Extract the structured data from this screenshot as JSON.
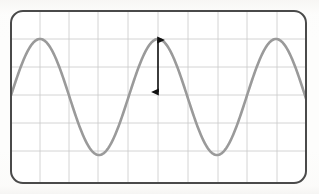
{
  "figure": {
    "kind": "oscilloscope-graticule-sine-wave",
    "width": 319,
    "height": 194,
    "background_color": "#fdfdfc"
  },
  "bezel": {
    "label": "screen-bezel",
    "x": 11,
    "y": 11,
    "width": 295,
    "height": 172,
    "corner_radius": 12,
    "stroke_color": "#4a4a4a",
    "stroke_width": 2.0,
    "fill_color": "#ffffff"
  },
  "graticule": {
    "label": "grid",
    "line_color": "#c9c9c9",
    "line_width": 0.8,
    "vertical_divisions": 10,
    "horizontal_divisions": 6,
    "vertical_line_x": [
      40,
      69,
      98,
      128,
      158,
      188,
      218,
      247,
      277
    ],
    "horizontal_line_y": [
      39,
      67,
      95,
      123,
      151
    ],
    "x_start": 11,
    "x_end": 306,
    "y_start": 11,
    "y_end": 183
  },
  "waveform": {
    "label": "sine-wave-trace",
    "stroke_color": "#9a9a9a",
    "stroke_width": 2.6,
    "shape": "sine",
    "cycles": 2.5,
    "period_px": 118,
    "peak_y": 39,
    "trough_y": 155,
    "center_y": 97,
    "amplitude_px": 58,
    "peaks_x": [
      40,
      158,
      277
    ],
    "troughs_x": [
      99,
      218
    ],
    "phase_start_x": 11,
    "phase_end_x": 306
  },
  "amplitude_arrow": {
    "label": "amplitude-measurement-arrow",
    "style": "double-headed",
    "color": "#111111",
    "stroke_width": 1.6,
    "x": 158,
    "y_top": 39,
    "y_bottom": 93,
    "head_length": 9,
    "head_width": 7,
    "measures": "amplitude"
  },
  "chart_data": {
    "type": "line",
    "title": "",
    "subtitle": "",
    "xlabel": "",
    "ylabel": "",
    "grid": true,
    "legend_position": "none",
    "annotations": [
      {
        "type": "double-headed-arrow",
        "text": "",
        "x": 158,
        "y_from": 39,
        "y_to": 93,
        "describes": "amplitude"
      }
    ],
    "xlim": [
      0,
      10
    ],
    "ylim": [
      -3,
      3
    ],
    "x_tick_labels": [],
    "y_tick_labels": [],
    "series": [
      {
        "name": "sine",
        "x": [
          0.0,
          0.25,
          0.5,
          0.75,
          1.0,
          1.25,
          1.5,
          1.75,
          2.0,
          2.25,
          2.5,
          2.75,
          3.0,
          3.25,
          3.5,
          3.75,
          4.0,
          4.25,
          4.5,
          4.75,
          5.0,
          5.25,
          5.5,
          5.75,
          6.0,
          6.25,
          6.5,
          6.75,
          7.0,
          7.25,
          7.5,
          7.75,
          8.0,
          8.25,
          8.5,
          8.75,
          9.0,
          9.25,
          9.5,
          9.75,
          10.0
        ],
        "values": [
          0.0,
          0.78,
          1.45,
          1.9,
          2.07,
          1.9,
          1.45,
          0.78,
          0.0,
          -0.78,
          -1.45,
          -1.9,
          -2.07,
          -1.9,
          -1.45,
          -0.78,
          0.0,
          0.78,
          1.45,
          1.9,
          2.07,
          1.9,
          1.45,
          0.78,
          0.0,
          -0.78,
          -1.45,
          -1.9,
          -2.07,
          -1.9,
          -1.45,
          -0.78,
          0.0,
          0.78,
          1.45,
          1.9,
          2.07,
          1.9,
          1.45,
          0.78,
          0.0
        ]
      }
    ]
  }
}
